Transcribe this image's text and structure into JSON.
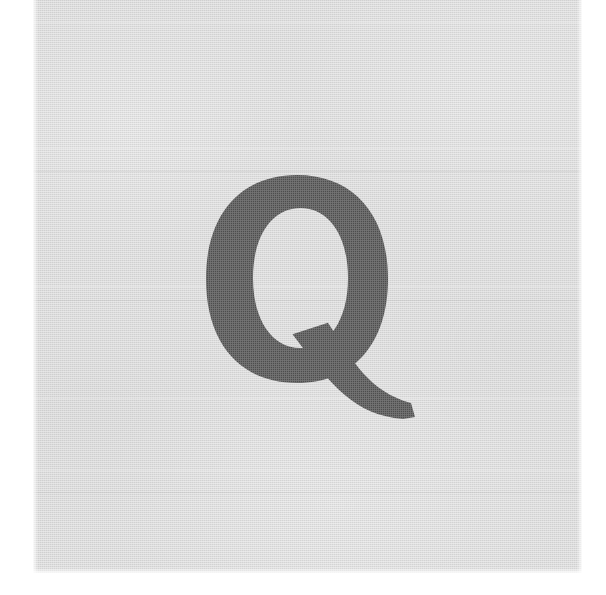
{
  "image": {
    "kind": "scanned-type-specimen",
    "subject_character": "Q",
    "subject_description": "Uppercase letter Q",
    "alt_text": "Uppercase letter Q",
    "width_px": 606,
    "height_px": 595
  },
  "canvas": {
    "background_color": "#ffffff"
  },
  "paper": {
    "label": "scanned paper sheet",
    "background_color": "#d6d6d6",
    "left_px": 33,
    "top_px": 0,
    "width_px": 549,
    "height_px": 573,
    "creases": [
      {
        "y_px": 22,
        "tone": "light"
      },
      {
        "y_px": 148,
        "tone": "light"
      },
      {
        "y_px": 171,
        "tone": "dark"
      },
      {
        "y_px": 286,
        "tone": "light"
      },
      {
        "y_px": 300,
        "tone": "dark"
      },
      {
        "y_px": 398,
        "tone": "light"
      },
      {
        "y_px": 470,
        "tone": "light"
      },
      {
        "y_px": 492,
        "tone": "dark"
      }
    ]
  },
  "glyph": {
    "character": "Q",
    "ink_color": "#4d4d4d",
    "style": "bold slab-serif uppercase",
    "bowl": {
      "left_px": 206,
      "top_px": 175,
      "right_px": 388,
      "bottom_px": 383,
      "stroke_weight_px": 47
    },
    "counter": {
      "left_px": 253,
      "top_px": 208,
      "right_px": 348,
      "bottom_px": 348
    },
    "tail": {
      "extends_right_to_px": 415,
      "extends_down_to_px": 417
    }
  }
}
